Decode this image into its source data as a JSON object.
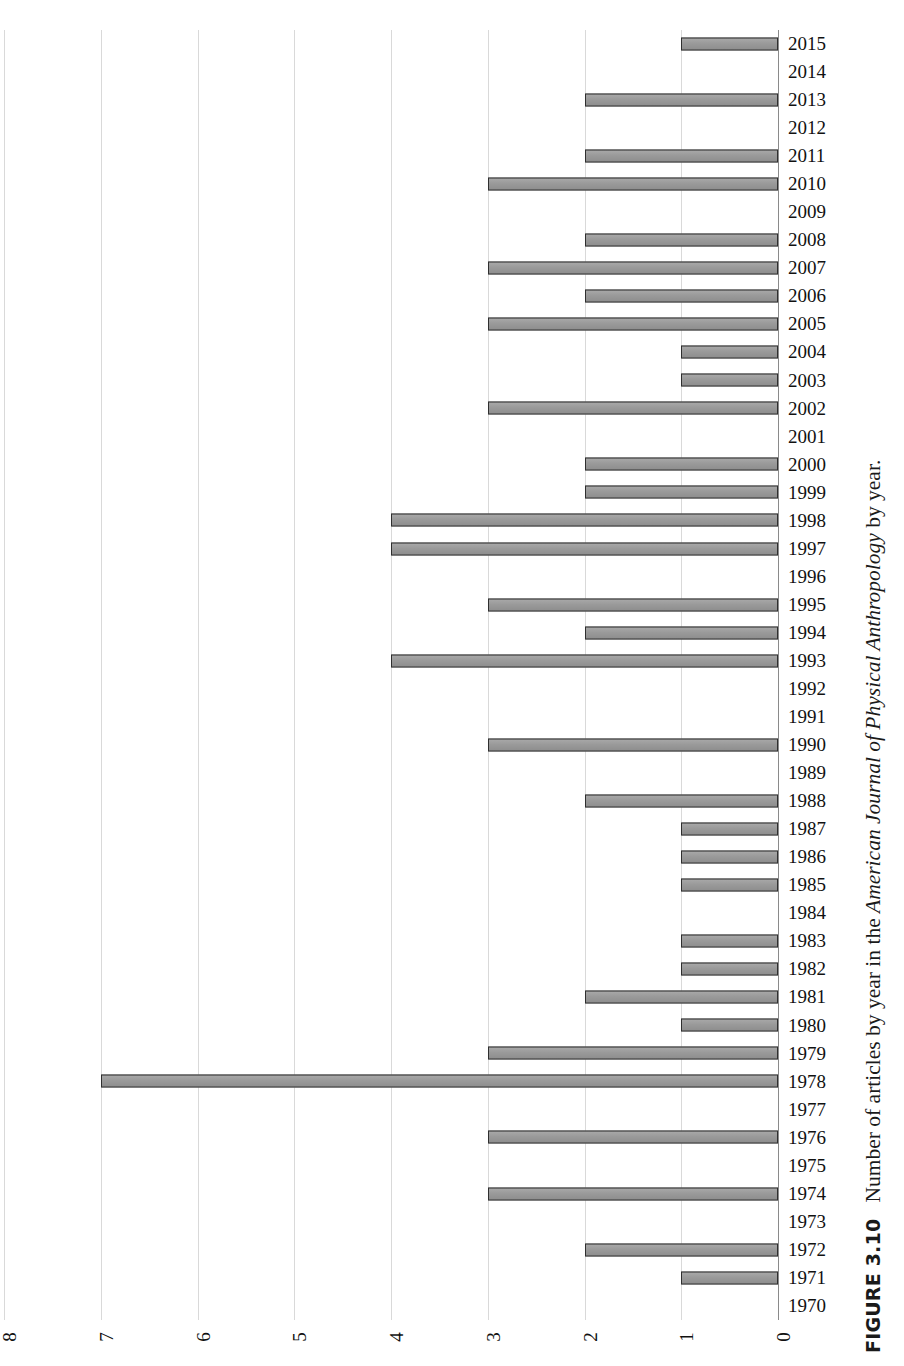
{
  "caption": {
    "label": "FIGURE 3.10",
    "text_before": "Number of articles by year in the ",
    "journal": "American Journal of Physical Anthropology",
    "text_after": " by year."
  },
  "chart_data": {
    "type": "bar",
    "orientation": "horizontal-rotated",
    "title": "Number of articles by year in the American Journal of Physical Anthropology by year.",
    "xlabel": "",
    "ylabel": "",
    "grid": true,
    "legend": "none",
    "value_axis_ticks": [
      8,
      7,
      6,
      5,
      4,
      3,
      2,
      1,
      0
    ],
    "value_axis_range": [
      0,
      8
    ],
    "categories": [
      "2015",
      "2014",
      "2013",
      "2012",
      "2011",
      "2010",
      "2009",
      "2008",
      "2007",
      "2006",
      "2005",
      "2004",
      "2003",
      "2002",
      "2001",
      "2000",
      "1999",
      "1998",
      "1997",
      "1996",
      "1995",
      "1994",
      "1993",
      "1992",
      "1991",
      "1990",
      "1989",
      "1988",
      "1987",
      "1986",
      "1985",
      "1984",
      "1983",
      "1982",
      "1981",
      "1980",
      "1979",
      "1978",
      "1977",
      "1976",
      "1975",
      "1974",
      "1973",
      "1972",
      "1971",
      "1970"
    ],
    "values": [
      1,
      0,
      2,
      0,
      2,
      3,
      0,
      2,
      3,
      2,
      3,
      1,
      1,
      3,
      0,
      2,
      2,
      4,
      4,
      0,
      3,
      2,
      4,
      0,
      0,
      3,
      0,
      2,
      1,
      1,
      1,
      0,
      1,
      1,
      2,
      1,
      3,
      7,
      0,
      3,
      0,
      3,
      0,
      2,
      1,
      0
    ]
  },
  "colors": {
    "bar_fill": "#9b9b9b",
    "bar_border": "#2f2f2f",
    "gridline": "#d9d9d9",
    "axis": "#8a8a8a",
    "text": "#111111",
    "background": "#ffffff"
  }
}
